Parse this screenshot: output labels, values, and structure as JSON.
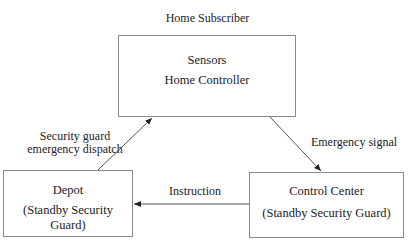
{
  "diagram": {
    "cutoff_top_text": "",
    "top_label": "Home Subscriber",
    "nodes": {
      "home": {
        "lines": [
          "Sensors",
          "Home Controller"
        ]
      },
      "depot": {
        "lines": [
          "Depot",
          "(Standby Security Guard)"
        ]
      },
      "control": {
        "lines": [
          "Control Center",
          "(Standby Security Guard)"
        ]
      }
    },
    "edges": {
      "dispatch": {
        "from": "depot",
        "to": "home",
        "label_lines": [
          "Security guard",
          "emergency dispatch"
        ]
      },
      "signal": {
        "from": "home",
        "to": "control",
        "label": "Emergency signal"
      },
      "instruction": {
        "from": "control",
        "to": "depot",
        "label": "Instruction"
      }
    }
  }
}
